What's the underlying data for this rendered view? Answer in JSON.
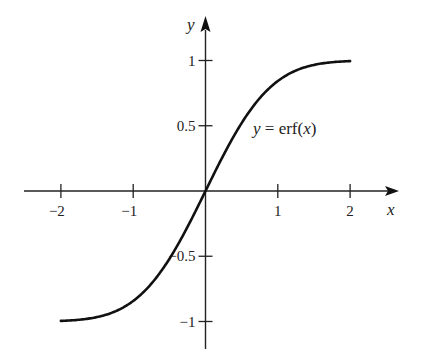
{
  "chart_data": {
    "type": "line",
    "title": "",
    "xlabel": "x",
    "ylabel": "y",
    "xlim": [
      -2.0,
      2.0
    ],
    "ylim": [
      -1.0,
      1.0
    ],
    "xticks": [
      -2,
      -1,
      1,
      2
    ],
    "xtick_labels": [
      "−2",
      "−1",
      "1",
      "2"
    ],
    "yticks": [
      1,
      0.5,
      -0.5,
      -1
    ],
    "ytick_labels": [
      "1",
      "0.5",
      "−0.5",
      "−1"
    ],
    "grid": false,
    "legend": null,
    "annotations": [
      {
        "text": "y = erf(x)",
        "x": 0.7,
        "y": 0.44
      }
    ],
    "series": [
      {
        "name": "y = erf(x)",
        "function": "erf",
        "x": [
          -2.0,
          -1.75,
          -1.5,
          -1.25,
          -1.0,
          -0.75,
          -0.5,
          -0.25,
          0.0,
          0.25,
          0.5,
          0.75,
          1.0,
          1.25,
          1.5,
          1.75,
          2.0
        ],
        "values": [
          -0.995,
          -0.987,
          -0.966,
          -0.923,
          -0.843,
          -0.711,
          -0.52,
          -0.276,
          0.0,
          0.276,
          0.52,
          0.711,
          0.843,
          0.923,
          0.966,
          0.987,
          0.995
        ]
      }
    ]
  },
  "labels": {
    "x_axis": "x",
    "y_axis": "y",
    "curve_prefix": "y",
    "curve_eq": " = erf(",
    "curve_var": "x",
    "curve_close": ")"
  }
}
